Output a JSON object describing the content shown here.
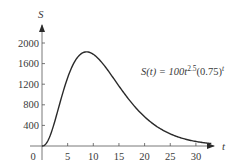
{
  "chart_data": {
    "type": "line",
    "title": "",
    "xlabel": "t",
    "ylabel": "S",
    "xlim": [
      0,
      33
    ],
    "ylim": [
      0,
      2100
    ],
    "x_ticks": [
      0,
      5,
      10,
      15,
      20,
      25,
      30
    ],
    "y_ticks": [
      400,
      800,
      1200,
      1600,
      2000
    ],
    "x_tick_labels": [
      "0",
      "5",
      "10",
      "15",
      "20",
      "25",
      "30"
    ],
    "y_tick_labels": [
      "400",
      "800",
      "1200",
      "1600",
      "2000"
    ],
    "grid": false,
    "legend": null,
    "annotations": [
      {
        "text_main": "S(t) = 100t",
        "sup1": "2.5",
        "text_mid": "(0.75)",
        "sup2": "t",
        "position": "right of curve near peak"
      }
    ],
    "series": [
      {
        "name": "S(t) = 100t^2.5(0.75)^t",
        "formula": "100*t^2.5*0.75^t",
        "x": [
          0,
          1,
          2,
          3,
          4,
          5,
          6,
          7,
          8,
          9,
          10,
          11,
          12,
          13,
          14,
          15,
          16,
          17,
          18,
          19,
          20,
          21,
          22,
          23,
          24,
          25,
          26,
          27,
          28,
          29,
          30,
          31,
          32,
          33
        ],
        "values": [
          0,
          75,
          318,
          631,
          1013,
          1327,
          1566,
          1721,
          1787,
          1775,
          1782,
          1676,
          1553,
          1406,
          1250,
          1096,
          950,
          815,
          692,
          582,
          486,
          402,
          330,
          270,
          219,
          177,
          142,
          114,
          91,
          72,
          57,
          45,
          35,
          27
        ]
      }
    ]
  },
  "axis": {
    "x_label": "t",
    "y_label": "S",
    "origin_label": "0"
  },
  "equation": {
    "lhs": "S(t) = 100t",
    "exp1": "2.5",
    "mid": "(0.75)",
    "exp2": "t"
  }
}
